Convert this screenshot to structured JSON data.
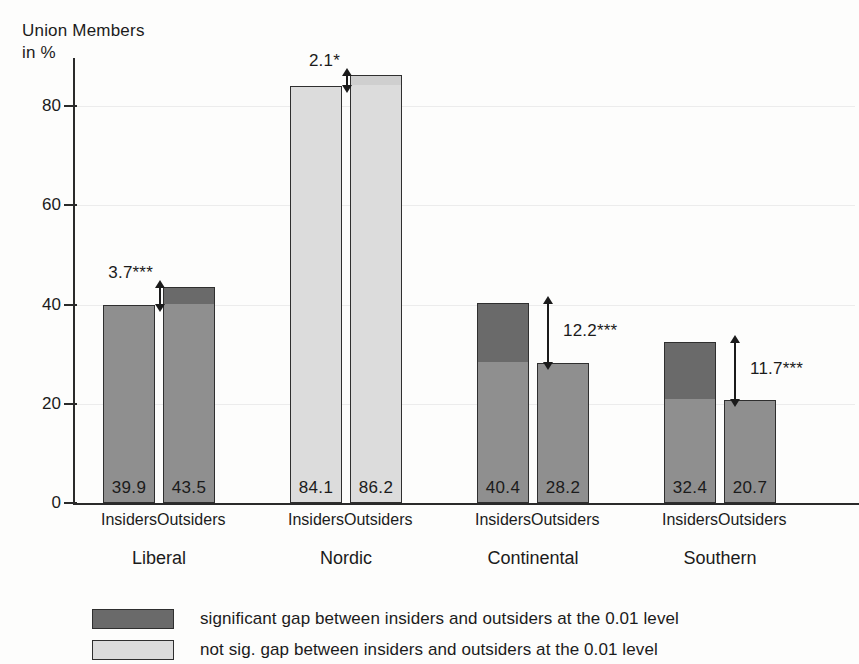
{
  "chart_data": {
    "type": "bar",
    "title": "",
    "ylabel": "Union Members\nin %",
    "xlabel": "",
    "ylim": [
      0,
      92
    ],
    "yticks": [
      0,
      20,
      40,
      60,
      80
    ],
    "ytick_labels": [
      "0",
      "20",
      "40",
      "60",
      "80"
    ],
    "grid": true,
    "categories": [
      "Liberal",
      "Nordic",
      "Continental",
      "Southern"
    ],
    "subcategories": [
      "Insiders",
      "Outsiders"
    ],
    "series": [
      {
        "name": "Insiders",
        "values": [
          39.9,
          84.1,
          40.4,
          32.4
        ]
      },
      {
        "name": "Outsiders",
        "values": [
          43.5,
          86.2,
          28.2,
          20.7
        ]
      }
    ],
    "groups": [
      {
        "name": "Liberal",
        "significant": true,
        "gap_label": "3.7***",
        "gap_value": 3.7,
        "bars": [
          {
            "label": "Insiders",
            "value": 39.9,
            "value_label": "39.9",
            "base": 39.9,
            "cap_from": 39.9,
            "cap_to": 39.9
          },
          {
            "label": "Outsiders",
            "value": 43.5,
            "value_label": "43.5",
            "base": 39.9,
            "cap_from": 39.9,
            "cap_to": 43.5
          }
        ]
      },
      {
        "name": "Nordic",
        "significant": false,
        "gap_label": "2.1*",
        "gap_value": 2.1,
        "bars": [
          {
            "label": "Insiders",
            "value": 84.1,
            "value_label": "84.1",
            "base": 84.1,
            "cap_from": 84.1,
            "cap_to": 84.1
          },
          {
            "label": "Outsiders",
            "value": 86.2,
            "value_label": "86.2",
            "base": 84.1,
            "cap_from": 84.1,
            "cap_to": 86.2
          }
        ]
      },
      {
        "name": "Continental",
        "significant": true,
        "gap_label": "12.2***",
        "gap_value": 12.2,
        "bars": [
          {
            "label": "Insiders",
            "value": 40.4,
            "value_label": "40.4",
            "base": 28.2,
            "cap_from": 28.2,
            "cap_to": 40.4
          },
          {
            "label": "Outsiders",
            "value": 28.2,
            "value_label": "28.2",
            "base": 28.2,
            "cap_from": 28.2,
            "cap_to": 28.2
          }
        ]
      },
      {
        "name": "Southern",
        "significant": true,
        "gap_label": "11.7***",
        "gap_value": 11.7,
        "bars": [
          {
            "label": "Insiders",
            "value": 32.4,
            "value_label": "32.4",
            "base": 20.7,
            "cap_from": 20.7,
            "cap_to": 32.4
          },
          {
            "label": "Outsiders",
            "value": 20.7,
            "value_label": "20.7",
            "base": 20.7,
            "cap_from": 20.7,
            "cap_to": 20.7
          }
        ]
      }
    ],
    "legend": {
      "position": "bottom",
      "entries": [
        {
          "swatch": "dark",
          "label": "significant gap between insiders and outsiders at the 0.01 level"
        },
        {
          "swatch": "light",
          "label": "not sig. gap between insiders and outsiders at the 0.01 level"
        }
      ]
    },
    "colors": {
      "significant_fill": "#8f8f8f",
      "significant_cap": "#6a6a6a",
      "not_significant_fill": "#dcdcdc",
      "not_significant_cap": "#cfcfcf",
      "outline": "#2f2f2f",
      "axis": "#2a2a2a",
      "text": "#1b1b1b",
      "grid": "#ececec",
      "background": "#fdfdfc"
    }
  }
}
